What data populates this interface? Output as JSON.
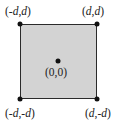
{
  "diagram": {
    "shape": "square",
    "fill_color": "#d3d3d3",
    "stroke_color": "#2a2a2a",
    "dot_color": "#111111",
    "points": [
      {
        "id": "top-left",
        "label": "(-d,d)",
        "parts": [
          "(-",
          "d",
          ",",
          "d",
          ")"
        ]
      },
      {
        "id": "top-right",
        "label": "(d,d)",
        "parts": [
          "(",
          "d",
          ",",
          "d",
          ")"
        ]
      },
      {
        "id": "center",
        "label": "(0,0)",
        "parts": [
          "(0,0)"
        ]
      },
      {
        "id": "bottom-left",
        "label": "(-d,-d)",
        "parts": [
          "(-",
          "d",
          ",-",
          "d",
          ")"
        ]
      },
      {
        "id": "bottom-right",
        "label": "(d,-d)",
        "parts": [
          "(",
          "d",
          ",-",
          "d",
          ")"
        ]
      }
    ]
  }
}
